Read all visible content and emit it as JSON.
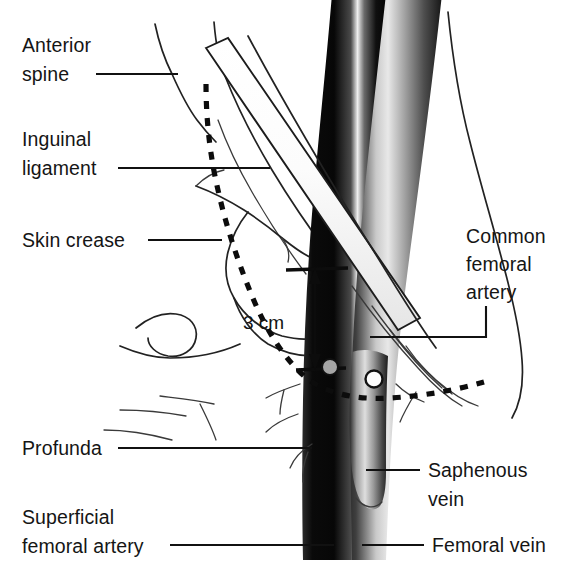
{
  "figure": {
    "background_color": "#ffffff",
    "ink_color": "#111111"
  },
  "labels": {
    "anterior_spine": {
      "line1": "Anterior",
      "line2": "spine"
    },
    "inguinal_ligament": {
      "line1": "Inguinal",
      "line2": "ligament"
    },
    "skin_crease": {
      "line1": "Skin crease"
    },
    "common_femoral_artery": {
      "line1": "Common",
      "line2": "femoral",
      "line3": "artery"
    },
    "profunda": {
      "line1": "Profunda"
    },
    "superficial_femoral_artery": {
      "line1": "Superficial",
      "line2": "femoral artery"
    },
    "saphenous_vein": {
      "line1": "Saphenous",
      "line2": "vein"
    },
    "femoral_vein": {
      "line1": "Femoral vein"
    }
  },
  "measurement": {
    "value": "3 cm"
  },
  "anatomy": {
    "artery_color": "#121212",
    "vein_color": "#6e6e6e",
    "ligament_color": "#fbfbfb",
    "puncture_marker_color": "#a6a6a6",
    "bone_outline_color": "#222222"
  },
  "markers": [
    {
      "name": "puncture-site-artery",
      "style": "filled"
    },
    {
      "name": "puncture-site-vein",
      "style": "open"
    }
  ]
}
